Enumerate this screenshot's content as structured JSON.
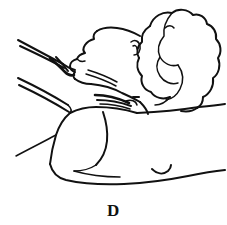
{
  "figure": {
    "label": "D",
    "caption_position": "bottom-center",
    "ink_color": "#111111",
    "background_color": "#ffffff",
    "media": "line-art pen drawing"
  },
  "canvas": {
    "width": 227,
    "height": 225,
    "viewbox": "0 0 227 225"
  },
  "parts": {
    "forehead": "forehead-contour",
    "nose": "nose-profile",
    "lips": "lips-profile",
    "chin": "chin-profile",
    "jaw": "jawline",
    "ear": "ear-mark",
    "hair": "curly-hair-mass",
    "neck": "neck-crease-lines",
    "hand": "examiner-hand-fingers",
    "arm": "forearm-lines",
    "shoulder": "shoulder-contour",
    "torso": "torso-and-bedding",
    "fold": "bedding-fold-mark"
  }
}
